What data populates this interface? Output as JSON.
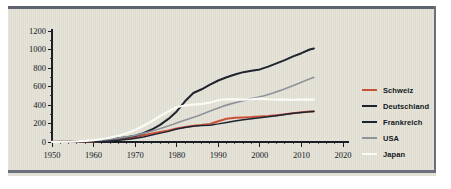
{
  "chart_data": {
    "type": "line",
    "title": "",
    "subtitle": "",
    "xlabel": "",
    "ylabel": "",
    "xlim": [
      1950,
      2020
    ],
    "ylim": [
      0,
      1200
    ],
    "xticks": [
      1950,
      1960,
      1970,
      1980,
      1990,
      2000,
      2010,
      2020
    ],
    "yticks": [
      0,
      200,
      400,
      600,
      800,
      1000,
      1200
    ],
    "grid": false,
    "legend_position": "right",
    "series": [
      {
        "name": "Schweiz",
        "color": "#c9513a",
        "x": [
          1950,
          1955,
          1960,
          1962,
          1965,
          1968,
          1970,
          1972,
          1975,
          1978,
          1980,
          1982,
          1984,
          1986,
          1988,
          1990,
          1992,
          1994,
          1996,
          1998,
          2000,
          2002,
          2004,
          2006,
          2008,
          2010,
          2012,
          2013
        ],
        "values": [
          2,
          3,
          5,
          10,
          22,
          38,
          52,
          72,
          100,
          125,
          145,
          162,
          175,
          183,
          196,
          225,
          252,
          262,
          266,
          270,
          276,
          282,
          290,
          300,
          312,
          322,
          330,
          333
        ]
      },
      {
        "name": "Deutschland",
        "color": "#1d242e",
        "x": [
          1950,
          1955,
          1958,
          1960,
          1962,
          1965,
          1968,
          1970,
          1972,
          1974,
          1976,
          1978,
          1980,
          1982,
          1984,
          1986,
          1988,
          1990,
          1992,
          1994,
          1996,
          1998,
          2000,
          2002,
          2004,
          2006,
          2008,
          2010,
          2012,
          2013
        ],
        "values": [
          2,
          4,
          12,
          14,
          20,
          35,
          52,
          68,
          95,
          135,
          185,
          250,
          330,
          440,
          530,
          570,
          620,
          665,
          700,
          730,
          755,
          770,
          785,
          815,
          850,
          885,
          925,
          960,
          1000,
          1010
        ]
      },
      {
        "name": "Frankreich",
        "color": "#1a2433",
        "x": [
          1950,
          1955,
          1960,
          1963,
          1966,
          1969,
          1972,
          1975,
          1978,
          1980,
          1982,
          1984,
          1986,
          1988,
          1990,
          1992,
          1994,
          1996,
          1998,
          2000,
          2002,
          2004,
          2006,
          2008,
          2010,
          2012,
          2013
        ],
        "values": [
          2,
          3,
          5,
          9,
          18,
          32,
          55,
          85,
          115,
          140,
          158,
          170,
          178,
          182,
          196,
          212,
          228,
          240,
          252,
          262,
          272,
          285,
          298,
          310,
          320,
          328,
          330
        ]
      },
      {
        "name": "USA",
        "color": "#8d949a",
        "x": [
          1950,
          1955,
          1958,
          1960,
          1963,
          1966,
          1969,
          1971,
          1973,
          1975,
          1977,
          1979,
          1981,
          1983,
          1985,
          1987,
          1989,
          1991,
          1993,
          1995,
          1997,
          1999,
          2001,
          2003,
          2005,
          2007,
          2009,
          2011,
          2013
        ],
        "values": [
          3,
          6,
          12,
          16,
          26,
          42,
          62,
          82,
          105,
          130,
          160,
          190,
          222,
          252,
          282,
          315,
          352,
          385,
          412,
          435,
          458,
          478,
          500,
          528,
          558,
          592,
          628,
          665,
          700
        ]
      },
      {
        "name": "Japan",
        "color": "#fbfbf6",
        "x": [
          1950,
          1955,
          1958,
          1960,
          1962,
          1964,
          1966,
          1968,
          1970,
          1972,
          1974,
          1976,
          1978,
          1980,
          1982,
          1984,
          1986,
          1988,
          1990,
          1992,
          1994,
          1996,
          1998,
          2000,
          2002,
          2004,
          2006,
          2008,
          2010,
          2012,
          2013
        ],
        "values": [
          2,
          5,
          12,
          20,
          32,
          48,
          68,
          95,
          130,
          175,
          225,
          280,
          330,
          378,
          395,
          405,
          412,
          425,
          452,
          462,
          460,
          458,
          462,
          470,
          462,
          458,
          458,
          456,
          458,
          458,
          458
        ]
      }
    ]
  },
  "legend": {
    "items": [
      {
        "label": "Schweiz",
        "color": "#c9513a"
      },
      {
        "label": "Deutschland",
        "color": "#1d242e"
      },
      {
        "label": "Frankreich",
        "color": "#1a2433"
      },
      {
        "label": "USA",
        "color": "#8d949a"
      },
      {
        "label": "Japan",
        "color": "#fbfbf6"
      }
    ]
  },
  "axes": {
    "y_tick_labels": [
      "1200",
      "1000",
      "800",
      "600",
      "400",
      "200",
      "0"
    ],
    "x_tick_labels": [
      "1950",
      "1960",
      "1970",
      "1980",
      "1990",
      "2000",
      "2010",
      "2020"
    ]
  },
  "colors": {
    "panel_background": "#dfdcd0",
    "rule": "#5d6470",
    "axis": "#1a1f26"
  }
}
